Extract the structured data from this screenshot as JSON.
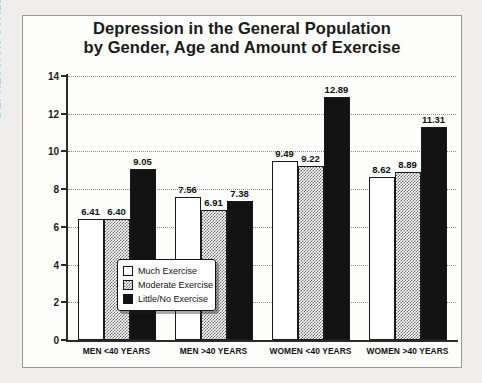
{
  "chart_data": {
    "type": "bar",
    "title": "Depression in the General Population by Gender, Age and Amount of Exercise",
    "title_line1": "Depression in the General Population",
    "title_line2": "by Gender, Age and Amount of Exercise",
    "xlabel": "",
    "ylabel": "DEPRESSION SCALE",
    "ylim": [
      0,
      14
    ],
    "ytick_step": 2,
    "yticks": [
      "0",
      "2",
      "4",
      "6",
      "8",
      "10",
      "12",
      "14"
    ],
    "grid": "horizontal-dotted",
    "legend_position": "inside-lower-left",
    "categories": [
      "MEN <40 YEARS",
      "MEN >40 YEARS",
      "WOMEN <40 YEARS",
      "WOMEN >40 YEARS"
    ],
    "series": [
      {
        "name": "Much Exercise",
        "fill": "white",
        "values": [
          6.41,
          7.56,
          9.49,
          8.62
        ]
      },
      {
        "name": "Moderate Exercise",
        "fill": "checker-gray",
        "values": [
          6.4,
          6.91,
          9.22,
          8.89
        ]
      },
      {
        "name": "Little/No Exercise",
        "fill": "black",
        "values": [
          9.05,
          7.38,
          12.89,
          11.31
        ]
      }
    ],
    "value_labels": [
      [
        "6.41",
        "6.40",
        "9.05"
      ],
      [
        "7.56",
        "6.91",
        "7.38"
      ],
      [
        "9.49",
        "9.22",
        "12.89"
      ],
      [
        "8.62",
        "8.89",
        "11.31"
      ]
    ]
  },
  "legend": {
    "items": [
      {
        "label": "Much Exercise"
      },
      {
        "label": "Moderate Exercise"
      },
      {
        "label": "Little/No Exercise"
      }
    ]
  },
  "colors": {
    "background": "#efeeec",
    "panel": "#fdfdfc",
    "axis": "#2a2a2a",
    "text": "#111111",
    "bar_much": "#ffffff",
    "bar_moderate": "#6e6e6e",
    "bar_little": "#121212",
    "gridline": "#8d8d8a"
  }
}
